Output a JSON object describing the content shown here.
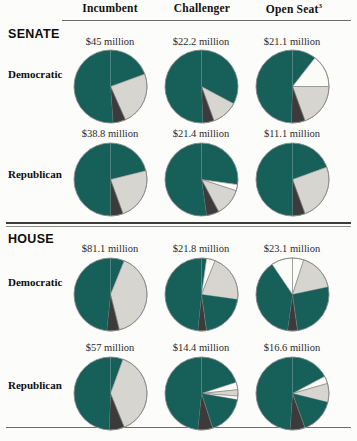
{
  "figure": {
    "columns": [
      {
        "label": "Incumbent",
        "sup": ""
      },
      {
        "label": "Challenger",
        "sup": ""
      },
      {
        "label": "Open Seat",
        "sup": "3"
      }
    ],
    "chambers": [
      {
        "label": "SENATE"
      },
      {
        "label": "HOUSE"
      }
    ],
    "parties": [
      "Democratic",
      "Republican",
      "Democratic",
      "Republican"
    ],
    "colors": {
      "green": "#17605a",
      "gray": "#d6d5d0",
      "white": "#fbfbf8",
      "dark": "#3b3b3b",
      "outline": "#8b8b8b",
      "rule": "#4a4a4a"
    }
  },
  "chart_data": {
    "type": "pie",
    "title": "",
    "xlabel": "",
    "ylabel": "",
    "legend": [
      "Individual contributions",
      "PAC contributions",
      "Party contributions",
      "Other"
    ],
    "series_colors": [
      "#17605a",
      "#d6d5d0",
      "#3b3b3b",
      "#fbfbf8"
    ],
    "grid": false,
    "panels": [
      {
        "chamber": "SENATE",
        "party": "Democratic",
        "column": "Incumbent",
        "total_label": "$45 million",
        "slices": [
          {
            "color": "green",
            "start": 0,
            "end": 70
          },
          {
            "color": "gray",
            "start": 70,
            "end": 156
          },
          {
            "color": "dark",
            "start": 156,
            "end": 176
          },
          {
            "color": "green",
            "start": 176,
            "end": 360
          }
        ]
      },
      {
        "chamber": "SENATE",
        "party": "Democratic",
        "column": "Challenger",
        "total_label": "$22.2 million",
        "slices": [
          {
            "color": "green",
            "start": 0,
            "end": 118
          },
          {
            "color": "gray",
            "start": 118,
            "end": 160
          },
          {
            "color": "dark",
            "start": 160,
            "end": 178
          },
          {
            "color": "green",
            "start": 178,
            "end": 360
          }
        ]
      },
      {
        "chamber": "SENATE",
        "party": "Democratic",
        "column": "Open Seat",
        "total_label": "$21.1 million",
        "slices": [
          {
            "color": "green",
            "start": 0,
            "end": 38
          },
          {
            "color": "white",
            "start": 38,
            "end": 90
          },
          {
            "color": "gray",
            "start": 90,
            "end": 160
          },
          {
            "color": "dark",
            "start": 160,
            "end": 182
          },
          {
            "color": "green",
            "start": 182,
            "end": 360
          }
        ]
      },
      {
        "chamber": "SENATE",
        "party": "Republican",
        "column": "Incumbent",
        "total_label": "$38.8 million",
        "slices": [
          {
            "color": "green",
            "start": 0,
            "end": 76
          },
          {
            "color": "gray",
            "start": 76,
            "end": 160
          },
          {
            "color": "dark",
            "start": 160,
            "end": 180
          },
          {
            "color": "green",
            "start": 180,
            "end": 360
          }
        ]
      },
      {
        "chamber": "SENATE",
        "party": "Republican",
        "column": "Challenger",
        "total_label": "$21.4 million",
        "slices": [
          {
            "color": "green",
            "start": 0,
            "end": 98
          },
          {
            "color": "white",
            "start": 98,
            "end": 108
          },
          {
            "color": "gray",
            "start": 108,
            "end": 152
          },
          {
            "color": "dark",
            "start": 152,
            "end": 172
          },
          {
            "color": "green",
            "start": 172,
            "end": 360
          }
        ]
      },
      {
        "chamber": "SENATE",
        "party": "Republican",
        "column": "Open Seat",
        "total_label": "$11.1 million",
        "slices": [
          {
            "color": "green",
            "start": 0,
            "end": 70
          },
          {
            "color": "gray",
            "start": 70,
            "end": 160
          },
          {
            "color": "dark",
            "start": 160,
            "end": 180
          },
          {
            "color": "green",
            "start": 180,
            "end": 360
          }
        ]
      },
      {
        "chamber": "HOUSE",
        "party": "Democratic",
        "column": "Incumbent",
        "total_label": "$81.1 million",
        "slices": [
          {
            "color": "green",
            "start": 0,
            "end": 22
          },
          {
            "color": "gray",
            "start": 22,
            "end": 166
          },
          {
            "color": "dark",
            "start": 166,
            "end": 186
          },
          {
            "color": "green",
            "start": 186,
            "end": 360
          }
        ]
      },
      {
        "chamber": "HOUSE",
        "party": "Democratic",
        "column": "Challenger",
        "total_label": "$21.8 million",
        "slices": [
          {
            "color": "green",
            "start": 0,
            "end": 8
          },
          {
            "color": "white",
            "start": 8,
            "end": 22
          },
          {
            "color": "gray",
            "start": 22,
            "end": 98
          },
          {
            "color": "green",
            "start": 98,
            "end": 172
          },
          {
            "color": "dark",
            "start": 172,
            "end": 186
          },
          {
            "color": "green",
            "start": 186,
            "end": 360
          }
        ]
      },
      {
        "chamber": "HOUSE",
        "party": "Democratic",
        "column": "Open Seat",
        "total_label": "$23.1 million",
        "slices": [
          {
            "color": "white",
            "start": 0,
            "end": 18
          },
          {
            "color": "gray",
            "start": 18,
            "end": 78
          },
          {
            "color": "green",
            "start": 78,
            "end": 172
          },
          {
            "color": "dark",
            "start": 172,
            "end": 188
          },
          {
            "color": "green",
            "start": 188,
            "end": 326
          },
          {
            "color": "white",
            "start": 326,
            "end": 360
          }
        ]
      },
      {
        "chamber": "HOUSE",
        "party": "Republican",
        "column": "Incumbent",
        "total_label": "$57 million",
        "slices": [
          {
            "color": "green",
            "start": 0,
            "end": 20
          },
          {
            "color": "gray",
            "start": 20,
            "end": 158
          },
          {
            "color": "dark",
            "start": 158,
            "end": 182
          },
          {
            "color": "green",
            "start": 182,
            "end": 360
          }
        ]
      },
      {
        "chamber": "HOUSE",
        "party": "Republican",
        "column": "Challenger",
        "total_label": "$14.4 million",
        "slices": [
          {
            "color": "green",
            "start": 0,
            "end": 72
          },
          {
            "color": "white",
            "start": 72,
            "end": 84
          },
          {
            "color": "gray",
            "start": 84,
            "end": 94
          },
          {
            "color": "white",
            "start": 94,
            "end": 100
          },
          {
            "color": "green",
            "start": 100,
            "end": 162
          },
          {
            "color": "dark",
            "start": 162,
            "end": 186
          },
          {
            "color": "green",
            "start": 186,
            "end": 360
          }
        ]
      },
      {
        "chamber": "HOUSE",
        "party": "Republican",
        "column": "Open Seat",
        "total_label": "$16.6 million",
        "slices": [
          {
            "color": "green",
            "start": 0,
            "end": 62
          },
          {
            "color": "white",
            "start": 62,
            "end": 74
          },
          {
            "color": "gray",
            "start": 74,
            "end": 104
          },
          {
            "color": "green",
            "start": 104,
            "end": 160
          },
          {
            "color": "dark",
            "start": 160,
            "end": 184
          },
          {
            "color": "green",
            "start": 184,
            "end": 360
          }
        ]
      }
    ]
  }
}
